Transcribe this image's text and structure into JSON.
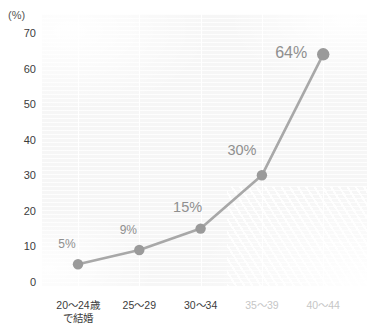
{
  "chart_data": {
    "type": "line",
    "title": "",
    "subtitle": "",
    "xlabel": "",
    "ylabel": "",
    "unit_label": "(%)",
    "categories": [
      "20〜24歳\nで結婚",
      "25〜29",
      "30〜34",
      "35〜39",
      "40〜44"
    ],
    "category_labels": [
      {
        "line1": "20〜24歳",
        "line2": "で結婚",
        "faded": false
      },
      {
        "line1": "25〜29",
        "line2": "",
        "faded": false
      },
      {
        "line1": "30〜34",
        "line2": "",
        "faded": false
      },
      {
        "line1": "35〜39",
        "line2": "",
        "faded": true
      },
      {
        "line1": "40〜44",
        "line2": "",
        "faded": true
      }
    ],
    "values": [
      5,
      9,
      15,
      30,
      64
    ],
    "point_labels": [
      "5%",
      "9%",
      "15%",
      "30%",
      "64%"
    ],
    "ylim": [
      0,
      70
    ],
    "ytick_values": [
      0,
      10,
      20,
      30,
      40,
      50,
      60,
      70
    ],
    "ytick_labels": [
      "0",
      "10",
      "20",
      "30",
      "40",
      "50",
      "60",
      "70"
    ],
    "grid": {
      "vertical": true,
      "horizontal": false
    },
    "legend": {
      "visible": false,
      "position": "none"
    },
    "colors": {
      "line": "#a8a8a8",
      "marker": "#9a9a9a",
      "label": "#8f8f8f",
      "axis_text": "#3c3c3c",
      "faded_text": "#c6c6c6",
      "plot_background": "#f6f6f6",
      "gridline": "#ffffff"
    }
  }
}
